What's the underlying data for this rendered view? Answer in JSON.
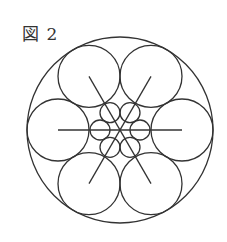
{
  "figure": {
    "label": "図 2",
    "stroke_color": "#333333",
    "outer_circle": {
      "cx": 120,
      "cy": 130,
      "r": 93
    },
    "large_circles": {
      "count": 6,
      "distance": 62,
      "r": 31,
      "start_angle_deg": 0
    },
    "small_circles": {
      "count": 6,
      "distance": 20,
      "r": 10,
      "start_angle_deg": 0
    },
    "lines": {
      "count": 3,
      "half_length": 62,
      "angles_deg": [
        0,
        60,
        120
      ]
    }
  }
}
